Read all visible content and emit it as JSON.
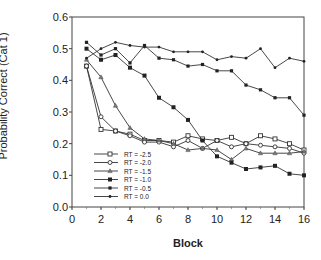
{
  "chart_data": {
    "type": "line",
    "title": "",
    "xlabel": "Block",
    "ylabel": "Probability Correct (Cat 1)",
    "xlim": [
      0,
      16
    ],
    "ylim": [
      0.0,
      0.6
    ],
    "x_ticks": [
      0,
      2,
      4,
      6,
      8,
      10,
      12,
      14,
      16
    ],
    "y_ticks": [
      0.0,
      0.1,
      0.2,
      0.3,
      0.4,
      0.5,
      0.6
    ],
    "y_tick_labels": [
      "0.0",
      "0.1",
      "0.2",
      "0.3",
      "0.4",
      "0.5",
      "0.6"
    ],
    "grid": false,
    "legend_position": "lower-left",
    "x": [
      1,
      2,
      3,
      4,
      5,
      6,
      7,
      8,
      9,
      10,
      11,
      12,
      13,
      14,
      15,
      16
    ],
    "series": [
      {
        "name": "RT = -2.5",
        "marker": "open-square",
        "values": [
          0.445,
          0.245,
          0.24,
          0.23,
          0.21,
          0.21,
          0.205,
          0.225,
          0.215,
          0.21,
          0.22,
          0.2,
          0.225,
          0.215,
          0.2,
          0.18
        ]
      },
      {
        "name": "RT = -2.0",
        "marker": "open-circle",
        "values": [
          0.445,
          0.285,
          0.24,
          0.225,
          0.205,
          0.205,
          0.19,
          0.21,
          0.185,
          0.21,
          0.19,
          0.2,
          0.195,
          0.19,
          0.185,
          0.17
        ]
      },
      {
        "name": "RT = -1.5",
        "marker": "triangle",
        "values": [
          0.465,
          0.41,
          0.32,
          0.25,
          0.215,
          0.21,
          0.2,
          0.18,
          0.185,
          0.18,
          0.15,
          0.185,
          0.17,
          0.17,
          0.17,
          0.175
        ]
      },
      {
        "name": "RT = -1.0",
        "marker": "filled-square",
        "values": [
          0.5,
          0.465,
          0.48,
          0.44,
          0.415,
          0.345,
          0.315,
          0.275,
          0.21,
          0.16,
          0.14,
          0.12,
          0.125,
          0.13,
          0.105,
          0.1
        ]
      },
      {
        "name": "RT = -0.5",
        "marker": "small-filled",
        "values": [
          0.52,
          0.48,
          0.5,
          0.455,
          0.51,
          0.47,
          0.465,
          0.445,
          0.45,
          0.43,
          0.43,
          0.385,
          0.37,
          0.345,
          0.345,
          0.29
        ]
      },
      {
        "name": "RT = 0.0",
        "marker": "small-dot",
        "values": [
          0.47,
          0.5,
          0.52,
          0.51,
          0.505,
          0.505,
          0.49,
          0.49,
          0.49,
          0.465,
          0.475,
          0.47,
          0.5,
          0.44,
          0.47,
          0.46
        ]
      }
    ]
  }
}
